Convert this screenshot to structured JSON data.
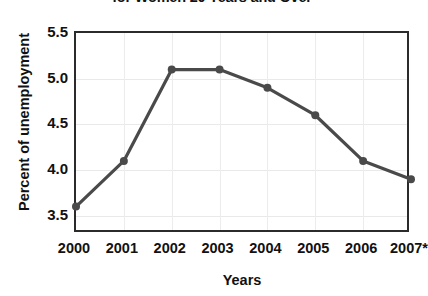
{
  "chart_data": {
    "type": "line",
    "title": "for Women 20 Years and Over",
    "title_note": "title is cropped by the top edge of the screenshot",
    "xlabel": "Years",
    "ylabel": "Percent of unemployment",
    "categories": [
      "2000",
      "2001",
      "2002",
      "2003",
      "2004",
      "2005",
      "2006",
      "2007*"
    ],
    "values": [
      3.6,
      4.1,
      5.1,
      5.1,
      4.9,
      4.6,
      4.1,
      3.9
    ],
    "yticks": [
      "5.5",
      "5.0",
      "4.5",
      "4.0",
      "3.5"
    ],
    "ytick_values": [
      5.5,
      5.0,
      4.5,
      4.0,
      3.5
    ],
    "ylim": [
      3.3,
      5.5
    ],
    "grid": true,
    "legend": "none",
    "series": [
      {
        "name": "Percent of unemployment",
        "values": [
          3.6,
          4.1,
          5.1,
          5.1,
          4.9,
          4.6,
          4.1,
          3.9
        ]
      }
    ],
    "colors": {
      "line": "#4a4a4a",
      "marker": "#4a4a4a",
      "axis": "#2b2b2b",
      "grid": "#ececec",
      "text": "#111111",
      "background": "#ffffff"
    }
  }
}
